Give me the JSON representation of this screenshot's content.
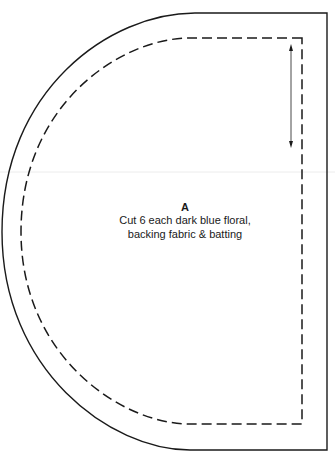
{
  "pattern": {
    "piece_label": "A",
    "instructions": [
      "Cut 6 each dark blue floral,",
      "backing fabric & batting"
    ],
    "lines": {
      "cutting_line": "solid",
      "seam_line": "dashed",
      "grainline": "double-arrow"
    },
    "colors": {
      "line": "#1a1a1a",
      "background": "#ffffff",
      "fold_guide": "#e8e8e8"
    }
  }
}
